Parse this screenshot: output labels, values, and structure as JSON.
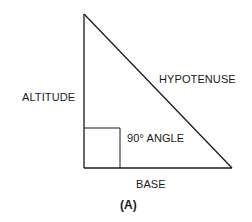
{
  "figure": {
    "caption": "(A)",
    "labels": {
      "altitude": "ALTITUDE",
      "hypotenuse": "HYPOTENUSE",
      "right_angle": "90° ANGLE",
      "base": "BASE"
    }
  },
  "geometry": {
    "vertices": {
      "top": [
        84,
        14
      ],
      "bottom_left": [
        84,
        168
      ],
      "bottom_right": [
        232,
        168
      ]
    },
    "right_angle_box": {
      "x": 84,
      "y": 128,
      "width": 36,
      "height": 40
    },
    "stroke_color": "#1a1a1a"
  }
}
